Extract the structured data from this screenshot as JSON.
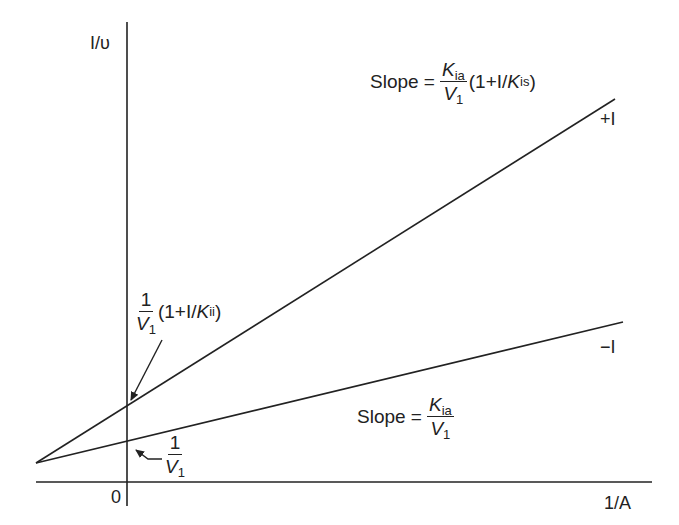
{
  "diagram": {
    "type": "lineweaver-burk-plot",
    "axes": {
      "y_label": "I/υ",
      "x_label": "1/A",
      "origin_label": "0"
    },
    "lines": [
      {
        "name": "with-inhibitor",
        "label": "+I",
        "from": [
          36,
          463
        ],
        "to": [
          615,
          99
        ]
      },
      {
        "name": "without-inhibitor",
        "label": "−I",
        "from": [
          36,
          463
        ],
        "to": [
          623,
          322
        ]
      }
    ],
    "annotations": {
      "slope_plus": {
        "prefix": "Slope =",
        "num_var": "K",
        "num_sub": "ia",
        "den_var": "V",
        "den_sub": "1",
        "suffix_open": "(1+I/",
        "suffix_var": "K",
        "suffix_sub": "is",
        "suffix_close": ")"
      },
      "slope_minus": {
        "prefix": "Slope =",
        "num_var": "K",
        "num_sub": "ia",
        "den_var": "V",
        "den_sub": "1"
      },
      "intercept_plus": {
        "num": "1",
        "den_var": "V",
        "den_sub": "1",
        "suffix_open": "(1+I/",
        "suffix_var": "K",
        "suffix_sub": "ii",
        "suffix_close": ")"
      },
      "intercept_minus": {
        "num": "1",
        "den_var": "V",
        "den_sub": "1"
      }
    },
    "colors": {
      "ink": "#222222",
      "background": "#ffffff"
    }
  }
}
